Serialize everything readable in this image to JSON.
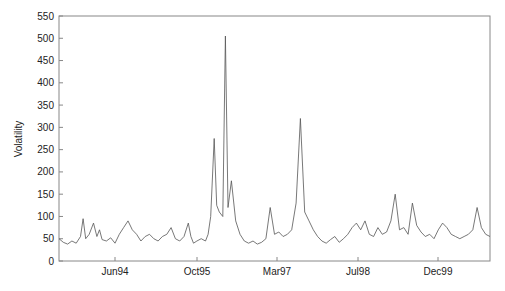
{
  "chart_data": {
    "type": "line",
    "title": "",
    "xlabel": "",
    "ylabel": "Volatility",
    "ylim": [
      0,
      550
    ],
    "yticks": [
      0,
      50,
      100,
      150,
      200,
      250,
      300,
      350,
      400,
      450,
      500,
      550
    ],
    "xticks": [
      "Jun94",
      "Oct95",
      "Mar97",
      "Jul98",
      "Dec99"
    ],
    "grid": false,
    "legend": null,
    "line_color": "#555555",
    "series": [
      {
        "name": "Volatility",
        "x_frac": [
          0.0,
          0.01,
          0.02,
          0.03,
          0.04,
          0.05,
          0.056,
          0.062,
          0.07,
          0.08,
          0.088,
          0.094,
          0.1,
          0.11,
          0.12,
          0.13,
          0.14,
          0.15,
          0.16,
          0.17,
          0.18,
          0.19,
          0.2,
          0.21,
          0.22,
          0.23,
          0.24,
          0.25,
          0.26,
          0.27,
          0.28,
          0.29,
          0.3,
          0.306,
          0.312,
          0.32,
          0.33,
          0.34,
          0.346,
          0.352,
          0.36,
          0.366,
          0.372,
          0.38,
          0.386,
          0.392,
          0.4,
          0.41,
          0.42,
          0.43,
          0.44,
          0.45,
          0.46,
          0.47,
          0.48,
          0.49,
          0.5,
          0.51,
          0.52,
          0.53,
          0.54,
          0.55,
          0.56,
          0.57,
          0.58,
          0.59,
          0.6,
          0.61,
          0.62,
          0.63,
          0.64,
          0.65,
          0.66,
          0.67,
          0.68,
          0.69,
          0.7,
          0.71,
          0.72,
          0.73,
          0.74,
          0.75,
          0.76,
          0.77,
          0.78,
          0.79,
          0.8,
          0.81,
          0.82,
          0.83,
          0.84,
          0.85,
          0.86,
          0.87,
          0.88,
          0.89,
          0.9,
          0.91,
          0.92,
          0.93,
          0.94,
          0.95,
          0.96,
          0.97,
          0.98,
          0.99,
          1.0
        ],
        "values": [
          50,
          42,
          38,
          45,
          40,
          55,
          95,
          50,
          60,
          85,
          55,
          70,
          48,
          45,
          52,
          40,
          60,
          75,
          90,
          70,
          60,
          45,
          55,
          60,
          50,
          45,
          55,
          60,
          75,
          50,
          45,
          55,
          85,
          55,
          40,
          45,
          50,
          45,
          60,
          100,
          275,
          125,
          110,
          100,
          505,
          120,
          180,
          90,
          60,
          45,
          40,
          45,
          38,
          42,
          50,
          120,
          60,
          65,
          55,
          60,
          70,
          130,
          320,
          110,
          90,
          70,
          55,
          45,
          40,
          48,
          55,
          42,
          50,
          60,
          75,
          85,
          70,
          90,
          60,
          55,
          75,
          60,
          65,
          90,
          150,
          70,
          75,
          60,
          130,
          80,
          65,
          55,
          60,
          50,
          70,
          85,
          75,
          60,
          55,
          50,
          55,
          60,
          70,
          120,
          75,
          60,
          55
        ]
      }
    ]
  },
  "axes": {
    "ylabel": "Volatility",
    "x_tick_labels": [
      "Jun94",
      "Oct95",
      "Mar97",
      "Jul98",
      "Dec99"
    ]
  }
}
